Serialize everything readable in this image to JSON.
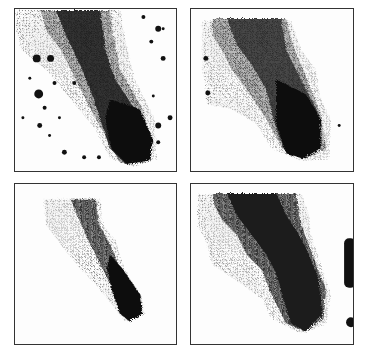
{
  "figure": {
    "layout": "2x2 grid of grayscale density panels",
    "panels": [
      {
        "id": "top-left",
        "description": "dithered scatter density with dark dense diagonal tail and scattered dots"
      },
      {
        "id": "top-right",
        "description": "smoothed density map, dark tail toward lower right with gray halo"
      },
      {
        "id": "bottom-left",
        "description": "narrow banded contour map, thin dark diagonal tail"
      },
      {
        "id": "bottom-right",
        "description": "wide banded contour map, broad dark diagonal band with light gray regions and edge blobs"
      }
    ],
    "colors": {
      "dark": "#111111",
      "mid": "#555555",
      "light": "#a8a8a8",
      "lighter": "#cfcfcf",
      "border": "#333333"
    }
  }
}
